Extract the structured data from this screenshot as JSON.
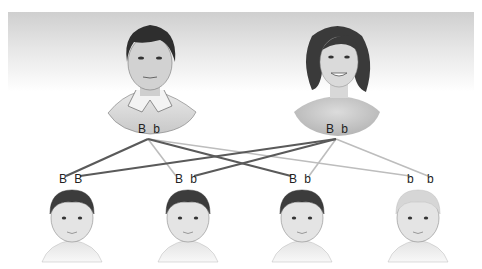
{
  "colors": {
    "dark_line": "#5a5a5a",
    "light_line": "#bdbdbd",
    "text": "#222222"
  },
  "parents": [
    {
      "id": "father",
      "label": "Father",
      "alleles": [
        "B",
        "b"
      ]
    },
    {
      "id": "mother",
      "label": "Mother",
      "alleles": [
        "B",
        "b"
      ]
    }
  ],
  "children": [
    {
      "id": "child-1",
      "alleles": [
        "B",
        "B"
      ],
      "hair": "dark"
    },
    {
      "id": "child-2",
      "alleles": [
        "B",
        "b"
      ],
      "hair": "dark"
    },
    {
      "id": "child-3",
      "alleles": [
        "B",
        "b"
      ],
      "hair": "dark"
    },
    {
      "id": "child-4",
      "alleles": [
        "b",
        "b"
      ],
      "hair": "light"
    }
  ],
  "connections": [
    {
      "from": "father",
      "to_child": 0,
      "to_allele": 0,
      "style": "dark"
    },
    {
      "from": "father",
      "to_child": 1,
      "to_allele": 0,
      "style": "light"
    },
    {
      "from": "father",
      "to_child": 2,
      "to_allele": 0,
      "style": "dark"
    },
    {
      "from": "father",
      "to_child": 3,
      "to_allele": 0,
      "style": "light"
    },
    {
      "from": "mother",
      "to_child": 0,
      "to_allele": 1,
      "style": "dark"
    },
    {
      "from": "mother",
      "to_child": 1,
      "to_allele": 1,
      "style": "dark"
    },
    {
      "from": "mother",
      "to_child": 2,
      "to_allele": 1,
      "style": "light"
    },
    {
      "from": "mother",
      "to_child": 3,
      "to_allele": 1,
      "style": "light"
    }
  ]
}
